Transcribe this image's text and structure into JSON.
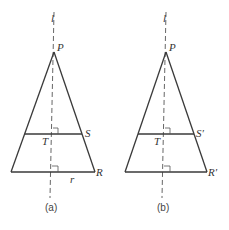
{
  "figures": [
    {
      "id": "a",
      "caption": "(a)",
      "labels": {
        "axis": "l",
        "apex": "P",
        "foot_upper": "T",
        "upper_right": "S",
        "lower_right": "R",
        "segment": "r"
      }
    },
    {
      "id": "b",
      "caption": "(b)",
      "labels": {
        "axis": "l",
        "apex": "P",
        "foot_upper": "T",
        "upper_right": "S′",
        "lower_right": "R′"
      }
    }
  ],
  "colors": {
    "line": "#3a3a3a",
    "dashed": "#555555",
    "text": "#333333"
  }
}
